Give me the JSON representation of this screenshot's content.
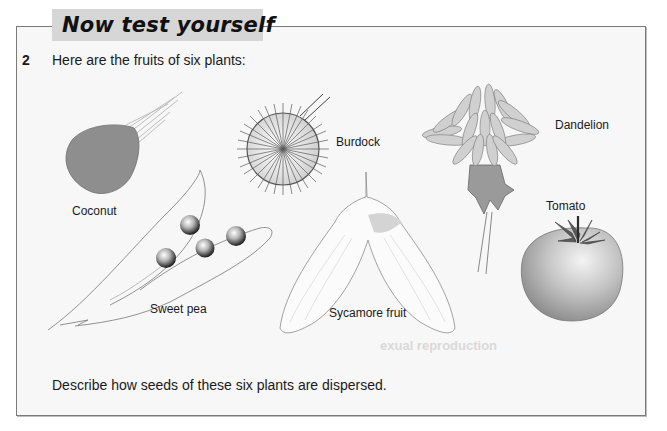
{
  "header": {
    "title": "Now test yourself"
  },
  "question": {
    "number": "2",
    "prompt": "Here are the fruits of six plants:",
    "task": "Describe how seeds of these six plants are dispersed."
  },
  "figure": {
    "fruits": [
      {
        "id": "coconut",
        "label": "Coconut"
      },
      {
        "id": "burdock",
        "label": "Burdock"
      },
      {
        "id": "dandelion",
        "label": "Dandelion"
      },
      {
        "id": "tomato",
        "label": "Tomato"
      },
      {
        "id": "sweet-pea",
        "label": "Sweet pea"
      },
      {
        "id": "sycamore",
        "label": "Sycamore fruit"
      }
    ]
  },
  "background_bleed": {
    "text": "exual reproduction"
  },
  "colors": {
    "box_background": "#f7f7f7",
    "box_border": "#7a7a7a",
    "title_tab": "#d6d6d6",
    "coconut_fill": "#8e8e8e",
    "tomato_fill": "#bdbdbd"
  }
}
